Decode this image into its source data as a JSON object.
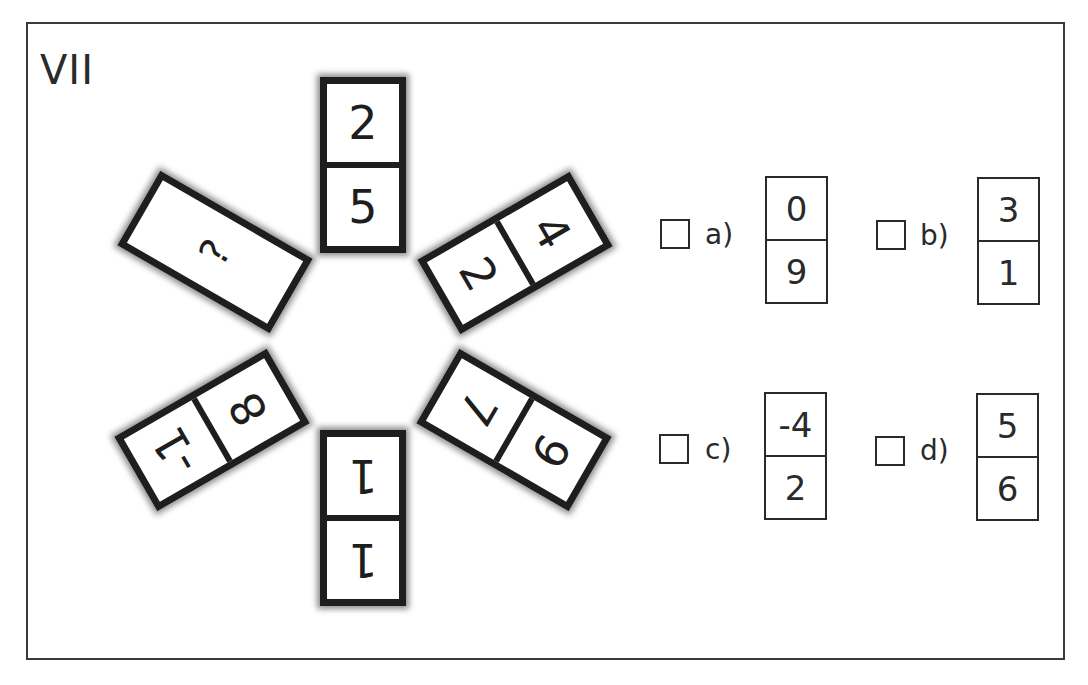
{
  "puzzle": {
    "title": "VII",
    "dominoes": [
      {
        "position": "top",
        "outer": "2",
        "inner": "5"
      },
      {
        "position": "upper-right",
        "outer": "4",
        "inner": "2"
      },
      {
        "position": "lower-right",
        "outer": "9",
        "inner": "7"
      },
      {
        "position": "bottom",
        "outer": "1",
        "inner": "1"
      },
      {
        "position": "lower-left",
        "outer": "-1",
        "inner": "8"
      },
      {
        "position": "upper-left",
        "value": "?"
      }
    ]
  },
  "options": [
    {
      "label": "a)",
      "top": "0",
      "bottom": "9"
    },
    {
      "label": "b)",
      "top": "3",
      "bottom": "1"
    },
    {
      "label": "c)",
      "top": "-4",
      "bottom": "2"
    },
    {
      "label": "d)",
      "top": "5",
      "bottom": "6"
    }
  ],
  "colors": {
    "ink": "#1e1e1e",
    "background": "#ffffff"
  }
}
